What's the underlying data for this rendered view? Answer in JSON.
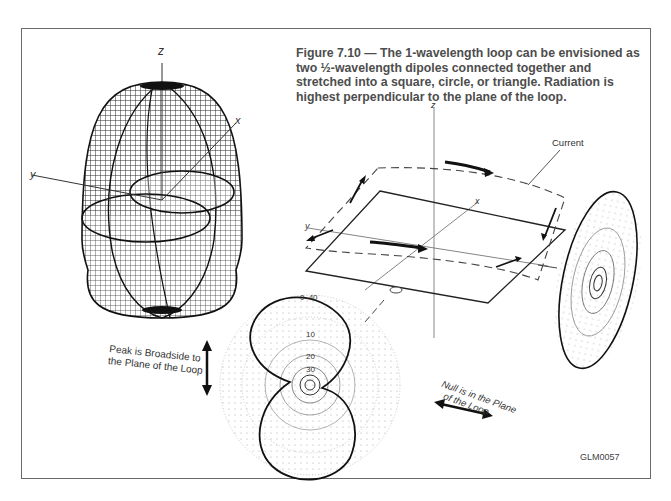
{
  "figure": {
    "number": "Figure 7.10",
    "caption": "Figure 7.10 — The 1-wavelength loop can be envisioned as two ½-wavelength dipoles connected together and stretched into a square, circle, or triangle. Radiation is highest perpendicular to the plane of the loop.",
    "id_code": "GLM0057"
  },
  "pattern_3d": {
    "axes": {
      "z": "z",
      "x": "x",
      "y": "y"
    },
    "shape": "doughnut-lobed elongated pattern"
  },
  "loop_diagram": {
    "axes": {
      "z": "z",
      "x": "x",
      "y": "y"
    },
    "current_label": "Current"
  },
  "elevation_plot": {
    "ring_labels": [
      "0",
      "-40",
      "10",
      "20",
      "30"
    ]
  },
  "annotations": {
    "peak_line1": "Peak is Broadside to",
    "peak_line2": "the Plane of the Loop",
    "null_line1": "Null is in the Plane",
    "null_line2": "of the Loop"
  }
}
